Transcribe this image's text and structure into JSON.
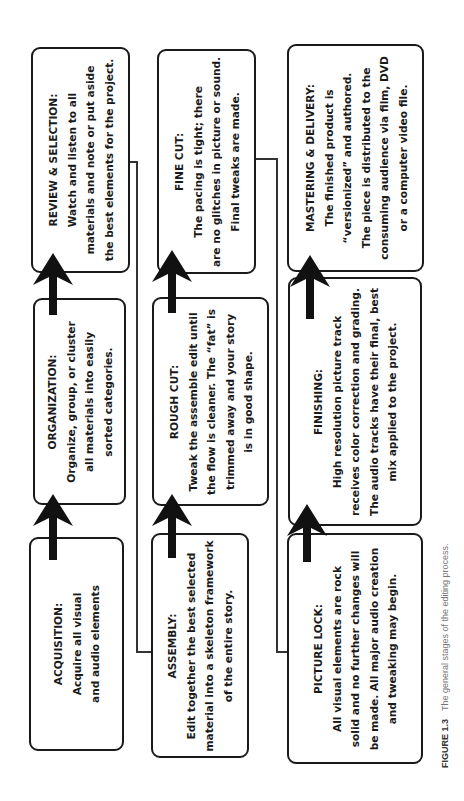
{
  "diagram": {
    "title": "The general stages of the editing process",
    "columns": [
      {
        "stages": [
          {
            "id": "acquisition",
            "title": "ACQUISITION:",
            "lines": [
              "Acquire all visual",
              "and audio elements"
            ]
          },
          {
            "id": "organization",
            "title": "ORGANIZATION:",
            "lines": [
              "Organize, group, or cluster",
              "all materials into easily",
              "sorted categories."
            ]
          },
          {
            "id": "review",
            "title": "REVIEW & SELECTION:",
            "lines": [
              "Watch and listen to all",
              "materials and note or put aside",
              "the best elements for the project."
            ]
          }
        ]
      },
      {
        "stages": [
          {
            "id": "assembly",
            "title": "ASSEMBLY:",
            "lines": [
              "Edit together the best selected",
              "material into a skeleton framework",
              "of the entire story."
            ]
          },
          {
            "id": "rough_cut",
            "title": "ROUGH CUT:",
            "lines": [
              "Tweak the assemble edit until",
              "the flow is cleaner. The “fat” is",
              "trimmed away and your story",
              "is in good shape."
            ]
          },
          {
            "id": "fine_cut",
            "title": "FINE CUT:",
            "lines": [
              "The pacing is tight; there",
              "are no glitches in picture or sound.",
              "Final tweaks are made."
            ]
          }
        ]
      },
      {
        "stages": [
          {
            "id": "picture_lock",
            "title": "PICTURE LOCK:",
            "lines": [
              "All visual elements are rock",
              "solid and no further changes will",
              "be made. All major audio creation",
              "and tweaking may begin."
            ]
          },
          {
            "id": "finishing",
            "title": "FINISHING:",
            "lines": [
              "High resolution picture track",
              "receives color correction and grading.",
              "The audio tracks have their final, best",
              "mix applied to the project."
            ]
          },
          {
            "id": "mastering",
            "title": "MASTERING & DELIVERY:",
            "lines": [
              "The finished product is",
              "“versionized” and authored.",
              "The piece is distributed to the",
              "consuming audience via film, DVD",
              "or a computer video file."
            ]
          }
        ]
      }
    ],
    "caption": {
      "label": "FIGURE 1.3",
      "text": "The general stages of the editing process."
    }
  },
  "colors": {
    "stroke": "#1a1a1a",
    "caption_text": "#777777"
  }
}
